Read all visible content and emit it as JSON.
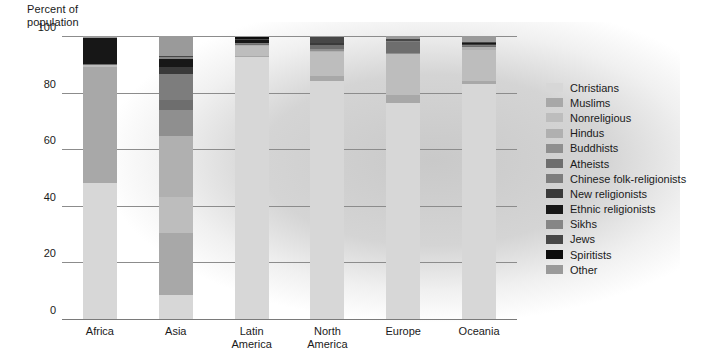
{
  "chart_data": {
    "type": "bar",
    "subtype": "stacked-bar-100",
    "title": "",
    "ylabel": "Percent of\npopulation",
    "xlabel": "",
    "ylim": [
      0,
      100
    ],
    "yticks": [
      0,
      20,
      40,
      60,
      80,
      100
    ],
    "ytick_labels": [
      "0",
      "20",
      "40",
      "60",
      "80",
      "100"
    ],
    "grid": true,
    "grid_axis": "y",
    "legend_position": "right",
    "categories": [
      "Africa",
      "Asia",
      "Latin\nAmerica",
      "North\nAmerica",
      "Europe",
      "Oceania"
    ],
    "category_labels": [
      "Africa",
      "Asia",
      "Latin America",
      "North America",
      "Europe",
      "Oceania"
    ],
    "series": [
      {
        "name": "Christians",
        "color": "#d7d7d7",
        "values": [
          48.0,
          8.5,
          92.5,
          84.0,
          76.5,
          83.0
        ]
      },
      {
        "name": "Muslims",
        "color": "#a8a8a8",
        "values": [
          41.0,
          22.0,
          0.5,
          1.8,
          2.5,
          1.2
        ]
      },
      {
        "name": "Nonreligious",
        "color": "#bdbdbd",
        "values": [
          0.5,
          12.5,
          3.5,
          8.5,
          14.5,
          11.0
        ]
      },
      {
        "name": "Hindus",
        "color": "#b0b0b0",
        "values": [
          0.2,
          21.5,
          0.3,
          0.4,
          0.3,
          0.8
        ]
      },
      {
        "name": "Buddhists",
        "color": "#8f8f8f",
        "values": [
          0.1,
          9.5,
          0.2,
          0.6,
          0.2,
          0.3
        ]
      },
      {
        "name": "Atheists",
        "color": "#6e6e6e",
        "values": [
          0.3,
          3.5,
          0.3,
          1.5,
          4.0,
          0.3
        ]
      },
      {
        "name": "Chinese folk-religionists",
        "color": "#7d7d7d",
        "values": [
          0.0,
          9.0,
          0.1,
          0.2,
          0.1,
          0.2
        ]
      },
      {
        "name": "New religionists",
        "color": "#3a3a3a",
        "values": [
          0.0,
          2.5,
          0.1,
          0.4,
          0.1,
          0.3
        ]
      },
      {
        "name": "Ethnic religionists",
        "color": "#171717",
        "values": [
          9.0,
          3.0,
          1.0,
          0.2,
          0.1,
          0.4
        ]
      },
      {
        "name": "Sikhs",
        "color": "#868686",
        "values": [
          0.0,
          0.6,
          0.0,
          0.1,
          0.1,
          0.1
        ]
      },
      {
        "name": "Jews",
        "color": "#474747",
        "values": [
          0.1,
          0.5,
          0.3,
          2.0,
          0.6,
          0.3
        ]
      },
      {
        "name": "Spiritists",
        "color": "#0d0d0d",
        "values": [
          0.0,
          0.0,
          0.8,
          0.1,
          0.0,
          0.0
        ]
      },
      {
        "name": "Other",
        "color": "#9a9a9a",
        "values": [
          0.7,
          6.9,
          0.4,
          0.2,
          1.0,
          2.1
        ]
      }
    ]
  },
  "legend": {
    "items": [
      {
        "label": "Christians",
        "color": "#d7d7d7"
      },
      {
        "label": "Muslims",
        "color": "#a8a8a8"
      },
      {
        "label": "Nonreligious",
        "color": "#bdbdbd"
      },
      {
        "label": "Hindus",
        "color": "#b0b0b0"
      },
      {
        "label": "Buddhists",
        "color": "#8f8f8f"
      },
      {
        "label": "Atheists",
        "color": "#6e6e6e"
      },
      {
        "label": "Chinese folk-religionists",
        "color": "#7d7d7d"
      },
      {
        "label": "New religionists",
        "color": "#3a3a3a"
      },
      {
        "label": "Ethnic religionists",
        "color": "#171717"
      },
      {
        "label": "Sikhs",
        "color": "#868686"
      },
      {
        "label": "Jews",
        "color": "#474747"
      },
      {
        "label": "Spiritists",
        "color": "#0d0d0d"
      },
      {
        "label": "Other",
        "color": "#9a9a9a"
      }
    ]
  }
}
